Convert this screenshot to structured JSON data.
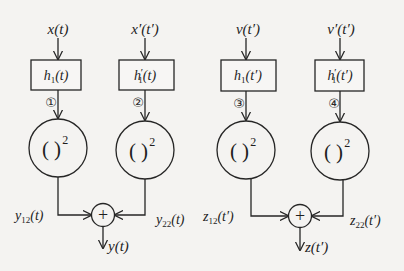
{
  "diagram": {
    "inputs": [
      {
        "id": "in1",
        "label": "x(t)"
      },
      {
        "id": "in2",
        "label": "x′(t′)"
      },
      {
        "id": "in3",
        "label": "v(t′)"
      },
      {
        "id": "in4",
        "label": "v′(t′)"
      }
    ],
    "filters": [
      {
        "id": "f1",
        "base": "h",
        "sub": "1",
        "arg": "(t)",
        "prime": ""
      },
      {
        "id": "f2",
        "base": "h",
        "sub": "1",
        "arg": "(t)",
        "prime": "′"
      },
      {
        "id": "f3",
        "base": "h",
        "sub": "1",
        "arg": "(t′)",
        "prime": ""
      },
      {
        "id": "f4",
        "base": "h",
        "sub": "1",
        "arg": "(t′)",
        "prime": "′"
      }
    ],
    "path_markers": [
      "①",
      "②",
      "③",
      "④"
    ],
    "squarers": [
      {
        "id": "sq1",
        "label": "( )",
        "exp": "2"
      },
      {
        "id": "sq2",
        "label": "( )",
        "exp": "2"
      },
      {
        "id": "sq3",
        "label": "( )",
        "exp": "2"
      },
      {
        "id": "sq4",
        "label": "( )",
        "exp": "2"
      }
    ],
    "intermediate": [
      {
        "id": "y12",
        "base": "y",
        "sub": "12",
        "arg": "(t)"
      },
      {
        "id": "y22",
        "base": "y",
        "sub": "22",
        "arg": "(t)"
      },
      {
        "id": "z12",
        "base": "z",
        "sub": "12",
        "arg": "(t′)"
      },
      {
        "id": "z22",
        "base": "z",
        "sub": "22",
        "arg": "(t′)"
      }
    ],
    "adders": [
      {
        "id": "sum1",
        "symbol": "+"
      },
      {
        "id": "sum2",
        "symbol": "+"
      }
    ],
    "outputs": [
      {
        "id": "out1",
        "label": "y(t)"
      },
      {
        "id": "out2",
        "label": "z(t′)"
      }
    ]
  }
}
